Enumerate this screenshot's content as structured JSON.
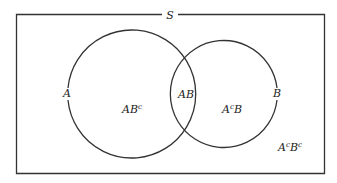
{
  "diagram": {
    "type": "venn",
    "universe_label": "S",
    "sets": [
      {
        "name": "A",
        "label": "A"
      },
      {
        "name": "B",
        "label": "B"
      }
    ],
    "regions": {
      "a_only": {
        "base": "AB",
        "sup": "c"
      },
      "intersection": {
        "text": "AB"
      },
      "b_only": {
        "pre": "A",
        "sup": "c",
        "post": "B"
      },
      "neither": {
        "pre": "A",
        "sup1": "c",
        "mid": "B",
        "sup2": "c"
      }
    }
  }
}
